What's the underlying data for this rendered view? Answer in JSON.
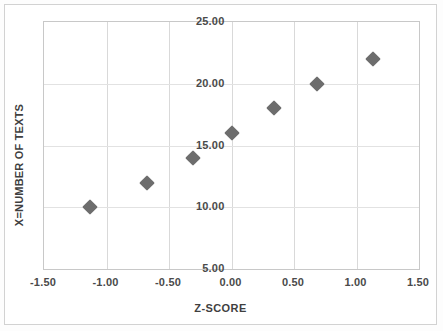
{
  "chart_data": {
    "type": "scatter",
    "title": "",
    "xlabel": "Z-SCORE",
    "ylabel": "X=NUMBER OF TEXTS",
    "xlim": [
      -1.5,
      1.5
    ],
    "ylim": [
      5.0,
      25.0
    ],
    "grid": true,
    "legend": false,
    "marker_color": "#6d6d6d",
    "marker_shape": "diamond",
    "xticks": [
      "-1.50",
      "-1.00",
      "-0.50",
      "0.00",
      "0.50",
      "1.00",
      "1.50"
    ],
    "xtick_values": [
      -1.5,
      -1.0,
      -0.5,
      0.0,
      0.5,
      1.0,
      1.5
    ],
    "yticks": [
      "5.00",
      "10.00",
      "15.00",
      "20.00",
      "25.00"
    ],
    "ytick_values": [
      5,
      10,
      15,
      20,
      25
    ],
    "x": [
      -1.13,
      -0.68,
      -0.31,
      0.0,
      0.34,
      0.68,
      1.13
    ],
    "y": [
      10,
      12,
      14,
      16,
      18,
      20,
      22
    ],
    "points": [
      {
        "x": -1.13,
        "y": 10
      },
      {
        "x": -0.68,
        "y": 12
      },
      {
        "x": -0.31,
        "y": 14
      },
      {
        "x": 0.0,
        "y": 16
      },
      {
        "x": 0.34,
        "y": 18
      },
      {
        "x": 0.68,
        "y": 20
      },
      {
        "x": 1.13,
        "y": 22
      }
    ]
  }
}
